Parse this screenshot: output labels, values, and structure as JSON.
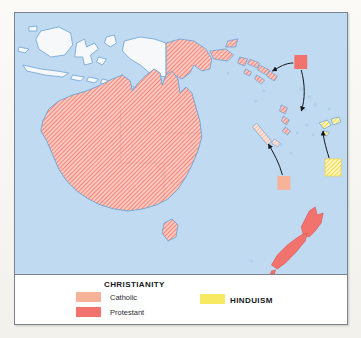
{
  "figure": {
    "frame_border_color": "#7d8490",
    "page_background": "#faf9f6"
  },
  "map": {
    "name": "australia-oceania-religion-map",
    "ocean_color": "#bfdaf1",
    "coastline_color": "#6aa3d8",
    "unshaded_land_color": "#f7f8f9",
    "projection_hint": "equirectangular",
    "regions": [
      {
        "name": "indonesia",
        "religion": "none-shown",
        "fill": "unshaded"
      },
      {
        "name": "papua-new-guinea",
        "religion": "Protestant",
        "fill": "hatch-protestant"
      },
      {
        "name": "australia",
        "religion": "Protestant",
        "fill": "hatch-protestant"
      },
      {
        "name": "tasmania",
        "religion": "Protestant",
        "fill": "hatch-protestant"
      },
      {
        "name": "new-zealand",
        "religion": "Protestant",
        "fill": "solid-protestant"
      },
      {
        "name": "solomon-islands",
        "religion": "Protestant",
        "fill": "hatch-protestant"
      },
      {
        "name": "vanuatu",
        "religion": "Protestant",
        "fill": "hatch-protestant"
      },
      {
        "name": "new-caledonia",
        "religion": "Catholic",
        "fill": "hatch-catholic"
      },
      {
        "name": "fiji",
        "religion": "Hinduism",
        "fill": "hatch-hinduism"
      }
    ],
    "callouts": [
      {
        "name": "callout-solomon-vanuatu",
        "swatch": "protestant",
        "color": "#f2736e",
        "box": {
          "x": 281,
          "y": 42,
          "w": 13,
          "h": 14
        },
        "arrows": [
          "to-solomon-islands",
          "to-vanuatu"
        ]
      },
      {
        "name": "callout-new-caledonia",
        "swatch": "catholic",
        "color": "#f7b29a",
        "box": {
          "x": 264,
          "y": 163,
          "w": 13,
          "h": 14
        },
        "arrows": [
          "to-new-caledonia"
        ]
      },
      {
        "name": "callout-fiji",
        "swatch": "hinduism",
        "color": "#f7ea62",
        "box": {
          "x": 312,
          "y": 146,
          "w": 16,
          "h": 17
        },
        "arrows": [
          "to-fiji"
        ]
      }
    ]
  },
  "legend": {
    "christianity": {
      "title": "CHRISTIANITY",
      "items": [
        {
          "label": "Catholic",
          "color": "#f7b29a"
        },
        {
          "label": "Protestant",
          "color": "#f2736e"
        }
      ]
    },
    "hinduism": {
      "title": "HINDUISM",
      "items": [
        {
          "label": "",
          "color": "#f7ea62"
        }
      ]
    }
  }
}
